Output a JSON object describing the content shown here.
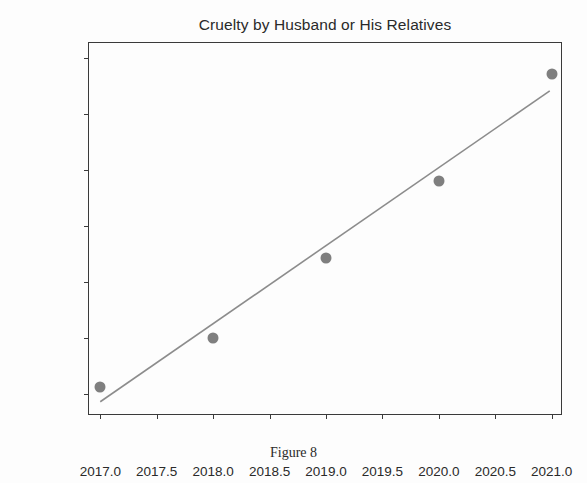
{
  "figure": {
    "caption": "Figure 8",
    "background_color": "#fdfdfd"
  },
  "chart_data": {
    "type": "scatter",
    "title": "Cruelty by Husband or His Relatives",
    "xlabel": "",
    "ylabel": "",
    "x": [
      2017,
      2018,
      2019,
      2020,
      2021
    ],
    "values": [
      55600,
      60000,
      67100,
      74000,
      83500
    ],
    "series": [
      {
        "name": "Cruelty by Husband or His Relatives",
        "type": "scatter",
        "marker_color": "#7f7f7f",
        "x": [
          2017,
          2018,
          2019,
          2020,
          2021
        ],
        "values": [
          55600,
          60000,
          67100,
          74000,
          83500
        ]
      },
      {
        "name": "Trend line",
        "type": "line",
        "line_color": "#8c8c8c",
        "x": [
          2017,
          2021
        ],
        "values": [
          54100,
          82000
        ]
      }
    ],
    "xlim": [
      2016.9,
      2021.1
    ],
    "ylim": [
      53000,
      86300
    ],
    "xticks": [
      2017.0,
      2017.5,
      2018.0,
      2018.5,
      2019.0,
      2019.5,
      2020.0,
      2020.5,
      2021.0
    ],
    "xtick_labels": [
      "2017.0",
      "2017.5",
      "2018.0",
      "2018.5",
      "2019.0",
      "2019.5",
      "2020.0",
      "2020.5",
      "2021.0"
    ],
    "yticks": [
      55000,
      60000,
      65000,
      70000,
      75000,
      80000,
      85000
    ],
    "ytick_labels": [
      "55000",
      "60000",
      "65000",
      "70000",
      "75000",
      "80000",
      "85000"
    ],
    "grid": false,
    "legend": false
  }
}
